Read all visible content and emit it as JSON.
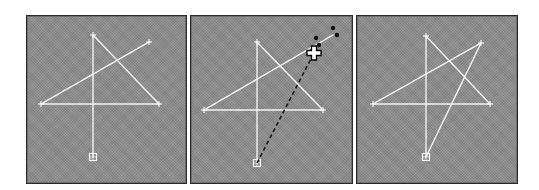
{
  "colors": {
    "background": "#ffffff",
    "panel_fill": "#8d8d8d",
    "panel_border": "#2a2a2a",
    "line": "#f4f4f4",
    "drag_line": "#1a1a1a",
    "dot": "#111111"
  },
  "panels": [
    {
      "id": "step-1",
      "rect": {
        "x": 26,
        "y": 15,
        "w": 161,
        "h": 169
      },
      "points": {
        "top": [
          93,
          35
        ],
        "upper_right": [
          149,
          42
        ],
        "left": [
          41,
          104
        ],
        "right": [
          159,
          104
        ],
        "bottom": [
          93,
          157
        ]
      },
      "segments": [
        [
          "bottom",
          "top"
        ],
        [
          "top",
          "right"
        ],
        [
          "right",
          "left"
        ],
        [
          "left",
          "upper_right"
        ]
      ],
      "end_point": "bottom",
      "drag": null
    },
    {
      "id": "step-2",
      "rect": {
        "x": 190,
        "y": 15,
        "w": 163,
        "h": 169
      },
      "points": {
        "top": [
          257,
          42
        ],
        "upper_right": [
          333,
          35
        ],
        "left": [
          204,
          110
        ],
        "right": [
          323,
          110
        ],
        "bottom": [
          257,
          163
        ]
      },
      "segments": [
        [
          "bottom",
          "top"
        ],
        [
          "top",
          "right"
        ],
        [
          "right",
          "left"
        ],
        [
          "left",
          "upper_right"
        ]
      ],
      "end_point": "bottom",
      "drag": {
        "from": [
          257,
          163
        ],
        "to": [
          314,
          53
        ],
        "cursor": {
          "type": "move-cursor",
          "at": [
            314,
            53
          ]
        },
        "dots": [
          [
            316,
            38
          ],
          [
            333,
            28
          ],
          [
            337,
            35
          ],
          [
            319,
            45
          ]
        ]
      }
    },
    {
      "id": "step-3",
      "rect": {
        "x": 356,
        "y": 15,
        "w": 162,
        "h": 169
      },
      "points": {
        "top": [
          426,
          36
        ],
        "upper_right": [
          481,
          43
        ],
        "left": [
          373,
          104
        ],
        "right": [
          490,
          104
        ],
        "bottom": [
          426,
          157
        ]
      },
      "segments": [
        [
          "bottom",
          "top"
        ],
        [
          "top",
          "right"
        ],
        [
          "right",
          "left"
        ],
        [
          "left",
          "upper_right"
        ],
        [
          "upper_right",
          "bottom"
        ]
      ],
      "end_point": "bottom",
      "drag": null
    }
  ]
}
